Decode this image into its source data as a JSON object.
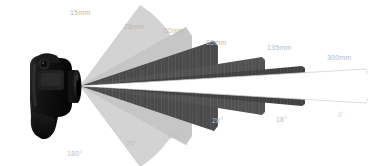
{
  "diagram": {
    "camera": {
      "name": "dslr-camera",
      "body_color": "#121212",
      "apex": {
        "x": 80,
        "y": 86
      }
    },
    "colors": {
      "background": "#ffffff",
      "sector_light": "#d2d2d2",
      "sector_mid": "#c2c2c2",
      "sector_dark": "#4a4a4a",
      "sector_white_fill": "#ffffff",
      "sector_white_stroke": "#cfcfcf",
      "label": "#b9b9b9",
      "beam_highlight": "#ffffff"
    },
    "wedges": [
      {
        "focal": "15mm",
        "angle": "180°",
        "angle_deg": 180,
        "fill": "#d2d2d2",
        "reach": 60,
        "style": "filled"
      },
      {
        "focal": "28mm",
        "angle": "75°",
        "angle_deg": 75,
        "fill": "#c4c4c4",
        "reach": 105,
        "style": "filled"
      },
      {
        "focal": "50mm",
        "angle": "47°",
        "angle_deg": 47,
        "fill": "#4a4a4a",
        "reach": 145,
        "style": "filled"
      },
      {
        "focal": "85mm",
        "angle": "28°",
        "angle_deg": 28,
        "fill": "#4f4f4f",
        "reach": 195,
        "style": "filled"
      },
      {
        "focal": "135mm",
        "angle": "18°",
        "angle_deg": 18,
        "fill": "#3f3f3f",
        "reach": 255,
        "style": "filled"
      },
      {
        "focal": "300mm",
        "angle": "8°",
        "angle_deg": 8,
        "fill": "#ffffff",
        "reach": 360,
        "style": "outline"
      }
    ],
    "labels": {
      "focal": {
        "f15": "15mm",
        "f28": "28mm",
        "f50": "50mm",
        "f85": "85mm",
        "f135": "135mm",
        "f300": "300mm"
      },
      "angle": {
        "a180": "180°",
        "a75": "75°",
        "a47": "47°",
        "a28": "28°",
        "a18": "18°",
        "a8": "8°"
      }
    }
  }
}
